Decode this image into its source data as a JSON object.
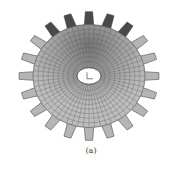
{
  "figure": {
    "caption": "(a)",
    "teeth": 20,
    "colors": {
      "face": "#b8b8b8",
      "mesh": "#555555",
      "dark": "#2a2a2a",
      "bore": "#ffffff"
    }
  }
}
